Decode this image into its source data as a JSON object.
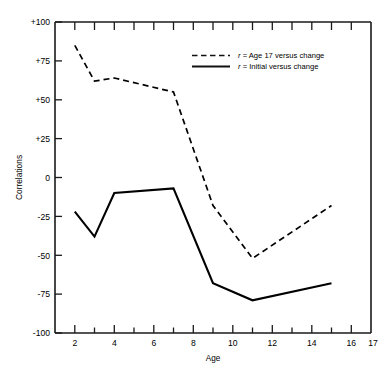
{
  "chart_data": {
    "type": "line",
    "title": "",
    "xlabel": "Age",
    "ylabel": "Correlations",
    "xlim": [
      1,
      17
    ],
    "ylim": [
      -100,
      100
    ],
    "grid": false,
    "legend_position": "top-center-right",
    "x_ticks_major": [
      2,
      4,
      6,
      8,
      10,
      12,
      14,
      16,
      17
    ],
    "x_tick_labels": [
      "2",
      "4",
      "6",
      "8",
      "10",
      "12",
      "14",
      "16",
      "17"
    ],
    "x_ticks_minor": [
      1,
      3,
      5,
      7,
      9,
      11,
      13,
      15
    ],
    "y_ticks": [
      100,
      75,
      50,
      25,
      0,
      -25,
      -50,
      -75,
      -100
    ],
    "y_tick_labels": [
      "+100",
      "+75",
      "+50",
      "+25",
      "0",
      "-25",
      "-50",
      "-75",
      "-100"
    ],
    "x": [
      2,
      3,
      4,
      7,
      9,
      11,
      15
    ],
    "series": [
      {
        "name": "r = Age 17 versus change",
        "style": "dashed",
        "color": "#000000",
        "x": [
          2,
          3,
          4,
          7,
          9,
          11,
          15
        ],
        "values": [
          85,
          62,
          64,
          55,
          -18,
          -52,
          -18
        ]
      },
      {
        "name": "r = Initial versus change",
        "style": "solid",
        "color": "#000000",
        "x": [
          2,
          3,
          4,
          7,
          9,
          11,
          15
        ],
        "values": [
          -22,
          -38,
          -10,
          -7,
          -68,
          -79,
          -68
        ]
      }
    ]
  },
  "axes": {
    "y_label": "Correlations",
    "x_label": "Age",
    "y_tick_labels": [
      "+100",
      "+75",
      "+50",
      "+25",
      "0",
      "-25",
      "-50",
      "-75",
      "-100"
    ],
    "x_tick_labels": [
      "2",
      "4",
      "6",
      "8",
      "10",
      "12",
      "14",
      "16",
      "17"
    ]
  },
  "legend": {
    "items": [
      {
        "r": "r",
        "text": " = Age 17 versus change",
        "style": "dashed"
      },
      {
        "r": "r",
        "text": " = Initial versus change",
        "style": "solid"
      }
    ]
  }
}
